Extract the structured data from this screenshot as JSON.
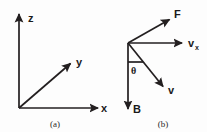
{
  "figure": {
    "stroke_color": "#231f20",
    "background_color": "#fdfdfd",
    "panels": [
      {
        "id": "a",
        "caption": "(a)",
        "type": "coordinate-axes-3d",
        "origin": [
          19,
          108
        ],
        "axes": [
          {
            "name": "z",
            "label": "z",
            "tip": [
              19,
              12
            ],
            "direction": "up"
          },
          {
            "name": "y",
            "label": "y",
            "tip": [
              72,
              62
            ],
            "direction": "up-right-diagonal"
          },
          {
            "name": "x",
            "label": "x",
            "tip": [
              100,
              108
            ],
            "direction": "right"
          }
        ]
      },
      {
        "id": "b",
        "caption": "(b)",
        "type": "vector-diagram",
        "vertex": [
          128,
          43
        ],
        "vectors": [
          {
            "name": "F",
            "label": "F",
            "tip": [
              171,
              18
            ],
            "direction": "up-right-diagonal"
          },
          {
            "name": "vx",
            "label": "v",
            "sublabel": "x",
            "tip": [
              184,
              43
            ],
            "direction": "right"
          },
          {
            "name": "v",
            "label": "v",
            "tip": [
              165,
              89
            ],
            "direction": "down-right-diagonal"
          },
          {
            "name": "B",
            "label": "B",
            "tip": [
              128,
              112
            ],
            "direction": "down"
          }
        ],
        "angle": {
          "name": "theta",
          "label": "θ",
          "between": [
            "B",
            "v"
          ]
        }
      }
    ]
  }
}
